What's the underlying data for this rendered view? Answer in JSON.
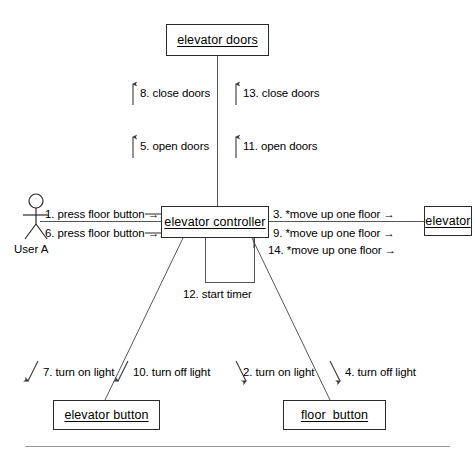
{
  "diagram": {
    "type": "uml-communication-diagram",
    "background_color": "#ffffff",
    "line_color": "#555555",
    "box_border_color": "#2b2b2b",
    "text_color": "#000000"
  },
  "actor": {
    "name": "User A",
    "icon": "stick-figure-actor-icon"
  },
  "objects": [
    {
      "id": "elevator_doors",
      "label": "elevator doors"
    },
    {
      "id": "elevator_controller",
      "label": "elevator controller"
    },
    {
      "id": "elevator",
      "label": "elevator"
    },
    {
      "id": "elevator_button",
      "label": "elevator button"
    },
    {
      "id": "floor_button",
      "label": "floor_button"
    }
  ],
  "messages": [
    {
      "seq": "1.",
      "text": "1. press floor button →",
      "from": "User A",
      "to": "elevator controller"
    },
    {
      "seq": "6.",
      "text": "6. press floor button →",
      "from": "User A",
      "to": "elevator controller"
    },
    {
      "seq": "8.",
      "text": "8. close doors",
      "from": "elevator controller",
      "to": "elevator doors"
    },
    {
      "seq": "13.",
      "text": "13. close doors",
      "from": "elevator controller",
      "to": "elevator doors"
    },
    {
      "seq": "5.",
      "text": "5. open doors",
      "from": "elevator controller",
      "to": "elevator doors"
    },
    {
      "seq": "11.",
      "text": "11. open doors",
      "from": "elevator controller",
      "to": "elevator doors"
    },
    {
      "seq": "3.",
      "text": "3. *move up one floor →",
      "from": "elevator controller",
      "to": "elevator"
    },
    {
      "seq": "9.",
      "text": "9. *move up one floor →",
      "from": "elevator controller",
      "to": "elevator"
    },
    {
      "seq": "14.",
      "text": "14. *move up one floor →",
      "from": "elevator controller",
      "to": "elevator"
    },
    {
      "seq": "12.",
      "text": "12. start timer",
      "from": "elevator controller",
      "to": "elevator controller"
    },
    {
      "seq": "7.",
      "text": "7. turn on light",
      "from": "elevator controller",
      "to": "elevator button"
    },
    {
      "seq": "10.",
      "text": "10. turn off light",
      "from": "elevator controller",
      "to": "elevator button"
    },
    {
      "seq": "2.",
      "text": "2. turn on light",
      "from": "elevator controller",
      "to": "floor_button"
    },
    {
      "seq": "4.",
      "text": "4. turn off light",
      "from": "elevator controller",
      "to": "floor_button"
    }
  ]
}
